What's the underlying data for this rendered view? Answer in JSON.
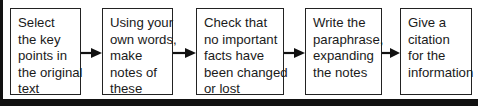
{
  "diagram": {
    "type": "flowchart",
    "direction": "left-to-right",
    "title_cropped": "",
    "steps": [
      {
        "id": 1,
        "lines": [
          "Select",
          "the key",
          "points in",
          "the original",
          "text"
        ]
      },
      {
        "id": 2,
        "lines": [
          "Using your",
          "own words,",
          "make",
          "notes of",
          "these"
        ]
      },
      {
        "id": 3,
        "lines": [
          "Check that",
          "no important",
          "facts have",
          "been changed",
          "or lost"
        ]
      },
      {
        "id": 4,
        "lines": [
          "Write the",
          "paraphrase,",
          "expanding",
          "the notes"
        ]
      },
      {
        "id": 5,
        "lines": [
          "Give a",
          "citation",
          "for the",
          "information"
        ]
      }
    ],
    "arrows": [
      {
        "from": 1,
        "to": 2
      },
      {
        "from": 2,
        "to": 3
      },
      {
        "from": 3,
        "to": 4
      },
      {
        "from": 4,
        "to": 5
      }
    ],
    "colors": {
      "border": "#222222",
      "arrow": "#111111",
      "frame": "#111111",
      "background": "#ffffff"
    }
  }
}
